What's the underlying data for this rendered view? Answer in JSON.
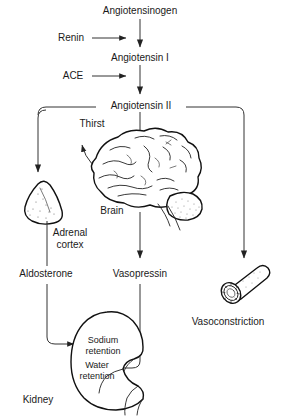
{
  "diagram": {
    "type": "flow-diagram",
    "background_color": "#ffffff",
    "line_color": "#333333",
    "text_color": "#1a1a1a",
    "nodes": {
      "angiotensinogen": "Angiotensinogen",
      "renin": "Renin",
      "angiotensin_1": "Angiotensin I",
      "ace": "ACE",
      "angiotensin_2": "Angiotensin II",
      "thirst": "Thirst",
      "brain": "Brain",
      "adrenal_cortex_line1": "Adrenal",
      "adrenal_cortex_line2": "cortex",
      "aldosterone": "Aldosterone",
      "vasopressin": "Vasopressin",
      "vasoconstriction": "Vasoconstriction",
      "sodium_retention_line1": "Sodium",
      "sodium_retention_line2": "retention",
      "water_retention_line1": "Water",
      "water_retention_line2": "retention",
      "kidney": "Kidney"
    },
    "organs": [
      "adrenal-gland",
      "brain",
      "blood-vessel",
      "kidney"
    ],
    "flow_sequence": [
      "Angiotensinogen",
      "Angiotensin I",
      "Angiotensin II"
    ]
  }
}
